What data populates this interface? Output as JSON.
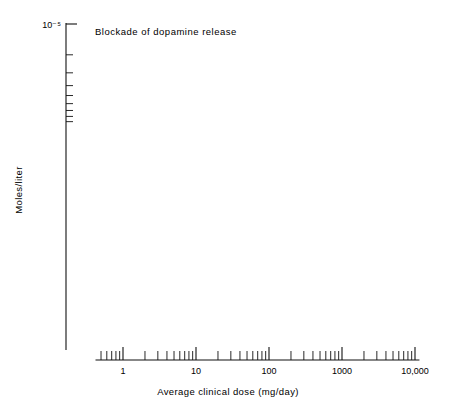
{
  "figure": {
    "title": "Blockade of dopamine release",
    "y_axis_title": "Moles/liter",
    "x_axis_title": "Average clinical dose (mg/day)"
  },
  "chart_data": {
    "type": "scatter",
    "title": "Blockade of dopamine release",
    "xlabel": "Average clinical dose (mg/day)",
    "ylabel": "Moles/liter",
    "xscale": "log",
    "yscale": "log",
    "xlim": [
      0.3,
      13000
    ],
    "ylim": [
      7e-09,
      1e-05
    ],
    "grid": false,
    "legend": "none",
    "xtick_labels": [
      "1",
      "10",
      "100",
      "1000",
      "10,000"
    ],
    "xtick_values": [
      1,
      10,
      100,
      1000,
      10000
    ],
    "ytick_labels": [
      "10⁻⁵",
      "10⁻⁶",
      "10⁻⁷",
      "10⁻⁸"
    ],
    "ytick_values": [
      1e-05,
      1e-06,
      1e-07,
      1e-08
    ],
    "regression_line": {
      "x": [
        0.38,
        9000
      ],
      "y": [
        8e-09,
        5.2e-06
      ]
    },
    "annotations": [],
    "points": [
      {
        "label": "Spiroperidol",
        "x": 0.5,
        "y": 1.2e-08,
        "xerr_lo": 0.42,
        "xerr_hi": 0.6,
        "yerr_lo": 1e-08,
        "yerr_hi": 1.5e-08,
        "label_side": "right"
      },
      {
        "label": "Benperidol",
        "x": 1.0,
        "y": 3e-08,
        "xerr_lo": 0.55,
        "xerr_hi": 1.9,
        "yerr_lo": 2.5e-08,
        "yerr_hi": 3.7e-08,
        "label_side": "left"
      },
      {
        "label": "Trifluperidol",
        "x": 3.0,
        "y": 3.8e-08,
        "xerr_lo": 2.0,
        "xerr_hi": 4.6,
        "yerr_lo": 3.8e-08,
        "yerr_hi": 3.8e-08,
        "label_side": "right-below"
      },
      {
        "label": "Pimozide",
        "x": 4.4,
        "y": 4.3e-08,
        "xerr_lo": 3.1,
        "xerr_hi": 6.4,
        "yerr_lo": 4.3e-08,
        "yerr_hi": 4.3e-08,
        "label_side": "right"
      },
      {
        "label": "Fluphenazine",
        "x": 5.3,
        "y": 4.9e-08,
        "xerr_lo": 3.7,
        "xerr_hi": 7.6,
        "yerr_lo": 4.4e-08,
        "yerr_hi": 5.4e-08,
        "label_side": "left"
      },
      {
        "label": "α-Flupenthixol",
        "x": 5.6,
        "y": 5.2e-08,
        "xerr_lo": 4.0,
        "xerr_hi": 8.0,
        "yerr_lo": 5.2e-08,
        "yerr_hi": 5.2e-08,
        "label_side": "right"
      },
      {
        "label": "Reserpine",
        "x": 7.0,
        "y": 6.2e-08,
        "xerr_lo": 5.0,
        "xerr_hi": 10.0,
        "yerr_lo": 6.2e-08,
        "yerr_hi": 6.2e-08,
        "label_side": "left"
      },
      {
        "label": "Haloperidol",
        "x": 15.0,
        "y": 8.6e-08,
        "xerr_lo": 7.5,
        "xerr_hi": 30.0,
        "yerr_lo": 7.3e-08,
        "yerr_hi": 1.02e-07,
        "label_side": "right"
      },
      {
        "label": "Thiothixene",
        "x": 30.0,
        "y": 1.35e-07,
        "xerr_lo": 20.0,
        "xerr_hi": 52.0,
        "yerr_lo": 1.35e-07,
        "yerr_hi": 1.35e-07,
        "label_side": "left"
      },
      {
        "label": "(+)-Butaclamol",
        "x": 36.0,
        "y": 1.48e-07,
        "xerr_lo": 25.0,
        "xerr_hi": 55.0,
        "yerr_lo": 1.48e-07,
        "yerr_hi": 1.48e-07,
        "label_side": "right-below"
      },
      {
        "label": "Moperone",
        "x": 38.0,
        "y": 1.75e-07,
        "xerr_lo": 26.0,
        "xerr_hi": 58.0,
        "yerr_lo": 1.75e-07,
        "yerr_hi": 1.75e-07,
        "label_side": "left"
      },
      {
        "label": "Trifluoperazine",
        "x": 42.0,
        "y": 1.62e-07,
        "xerr_lo": 30.0,
        "xerr_hi": 62.0,
        "yerr_lo": 1.62e-07,
        "yerr_hi": 1.62e-07,
        "label_side": "right"
      },
      {
        "label": "Molindone",
        "x": 90.0,
        "y": 2.7e-07,
        "xerr_lo": 62.0,
        "xerr_hi": 140.0,
        "yerr_lo": 2.7e-07,
        "yerr_hi": 2.7e-07,
        "label_side": "left"
      },
      {
        "label": "Prochlorperazine",
        "x": 110.0,
        "y": 3e-07,
        "xerr_lo": 78.0,
        "xerr_hi": 165.0,
        "yerr_lo": 3e-07,
        "yerr_hi": 3e-07,
        "label_side": "left"
      },
      {
        "label": "Lenperone",
        "x": 135.0,
        "y": 3.3e-07,
        "xerr_lo": 95.0,
        "xerr_hi": 200.0,
        "yerr_lo": 3.3e-07,
        "yerr_hi": 3.3e-07,
        "label_side": "right-below"
      },
      {
        "label": "Metiapine",
        "x": 160.0,
        "y": 3.6e-07,
        "xerr_lo": 110.0,
        "xerr_hi": 240.0,
        "yerr_lo": 3.6e-07,
        "yerr_hi": 3.6e-07,
        "label_side": "left"
      },
      {
        "label": "Clozapine",
        "x": 230.0,
        "y": 4.2e-07,
        "xerr_lo": 150.0,
        "xerr_hi": 350.0,
        "yerr_lo": 4.2e-07,
        "yerr_hi": 4.2e-07,
        "label_side": "left"
      },
      {
        "label": "Perazine",
        "x": 300.0,
        "y": 4.4e-07,
        "xerr_lo": 210.0,
        "xerr_hi": 440.0,
        "yerr_lo": 4.4e-07,
        "yerr_hi": 4.4e-07,
        "label_side": "right"
      },
      {
        "label": "Trazodone",
        "x": 300.0,
        "y": 5.9e-07,
        "xerr_lo": 200.0,
        "xerr_hi": 450.0,
        "yerr_lo": 5.9e-07,
        "yerr_hi": 5.9e-07,
        "label_side": "left-above"
      },
      {
        "label": "Chlorpromazine",
        "x": 450.0,
        "y": 7e-07,
        "xerr_lo": 290.0,
        "xerr_hi": 720.0,
        "yerr_lo": 7e-07,
        "yerr_hi": 7e-07,
        "label_side": "right"
      },
      {
        "label": "Thioridazine",
        "x": 430.0,
        "y": 7.3e-07,
        "xerr_lo": 300.0,
        "xerr_hi": 640.0,
        "yerr_lo": 6.3e-07,
        "yerr_hi": 8.8e-07,
        "label_side": "left"
      },
      {
        "label": "Pipamperone",
        "x": 300.0,
        "y": 1.32e-06,
        "xerr_lo": 130.0,
        "xerr_hi": 700.0,
        "yerr_lo": 1.02e-06,
        "yerr_hi": 1.6e-06,
        "label_side": "above"
      },
      {
        "label": "P-4657A",
        "x": 5500.0,
        "y": 2.6e-06,
        "xerr_lo": 5500.0,
        "xerr_hi": 5500.0,
        "yerr_lo": 2e-06,
        "yerr_hi": 3.4e-06,
        "label_side": "left-dotted"
      }
    ]
  }
}
